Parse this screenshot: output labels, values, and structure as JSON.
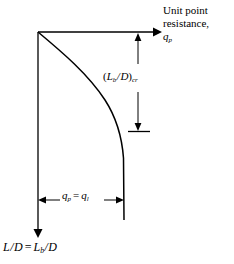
{
  "figure": {
    "name": "unit-point-resistance-vs-embedment-ratio-diagram",
    "background_color": "#ffffff",
    "line_color": "#000000",
    "width": 234,
    "height": 264
  },
  "axes": {
    "horizontal": {
      "name": "unit-point-resistance-axis",
      "label_lines": [
        "Unit point",
        "resistance,"
      ],
      "label_symbol": "q",
      "label_symbol_subscript": "p",
      "arrow": "right",
      "x_start": 38,
      "x_end": 160,
      "y": 32
    },
    "vertical": {
      "name": "embedment-ratio-axis",
      "label_left": "L",
      "label_slash": "/",
      "label_denominator": "D",
      "label_equals": "=",
      "label_right": "L",
      "label_right_subscript": "b",
      "label_right_denominator": "D",
      "arrow": "down",
      "x": 38,
      "y_start": 32,
      "y_end": 238
    }
  },
  "curve": {
    "name": "point-resistance-curve",
    "description": "Unit point resistance increases then becomes constant at limiting value",
    "start": [
      38,
      32
    ],
    "end": [
      124,
      220
    ],
    "asymptote_x": 124
  },
  "dimensions": {
    "critical_embedment": {
      "name": "critical-embedment-ratio-dimension",
      "text_open_paren": "(",
      "text_numerator": "L",
      "text_numerator_subscript": "b",
      "text_slash": "/",
      "text_denominator": "D",
      "text_close_paren": ")",
      "text_subscript": "cr",
      "x": 138,
      "y_top": 32,
      "y_bottom": 131
    },
    "limiting_resistance": {
      "name": "limiting-resistance-dimension",
      "text_left": "q",
      "text_left_subscript": "p",
      "text_equals": "=",
      "text_right": "q",
      "text_right_subscript": "l",
      "y": 200,
      "x_left": 38,
      "x_right": 124
    }
  }
}
